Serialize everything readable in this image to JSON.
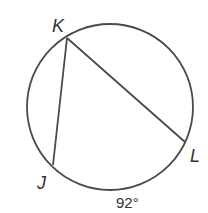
{
  "figure": {
    "type": "circle-inscribed-angle",
    "points": {
      "K": {
        "label": "K"
      },
      "J": {
        "label": "J"
      },
      "L": {
        "label": "L"
      }
    },
    "chords": [
      "KJ",
      "KL"
    ],
    "arc": {
      "endpoints": "JL",
      "measure_label": "92°"
    },
    "stroke_color": "#4a4a4a"
  }
}
